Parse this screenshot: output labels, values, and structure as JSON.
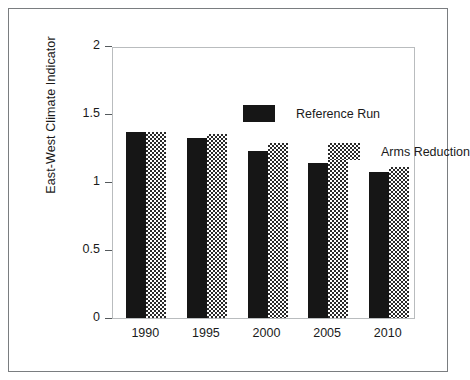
{
  "chart_data": {
    "type": "bar",
    "title": "",
    "xlabel": "",
    "ylabel": "East-West Climate Indicator",
    "categories": [
      "1990",
      "1995",
      "2000",
      "2005",
      "2010"
    ],
    "series": [
      {
        "name": "Reference Run",
        "values": [
          1.37,
          1.32,
          1.23,
          1.14,
          1.07
        ],
        "swatch": "solid-black",
        "color": "#161616"
      },
      {
        "name": "Arms Reduction",
        "values": [
          1.37,
          1.35,
          1.29,
          1.18,
          1.11
        ],
        "swatch": "checkered-gray",
        "color": "#808080"
      }
    ],
    "ylim": [
      0,
      2
    ],
    "yticks": [
      "0",
      "0.5",
      "1",
      "1.5",
      "2"
    ],
    "ytick_values": [
      0,
      0.5,
      1,
      1.5,
      2
    ],
    "grid": false,
    "legend_position": "inside-top-left-staggered",
    "frame_color": "#7a7d80",
    "axis_color": "#b9bcbe",
    "background": "#ffffff"
  }
}
